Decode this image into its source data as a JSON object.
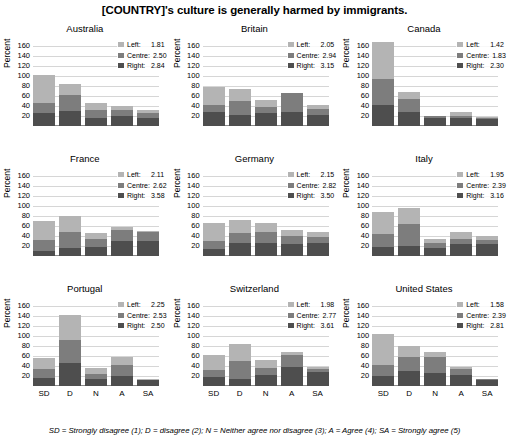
{
  "chart_data": {
    "type": "bar",
    "title": "[COUNTRY]'s culture is generally harmed by immigrants.",
    "subtitle": "",
    "xlabel": "",
    "ylabel": "Percent",
    "ylim": [
      0,
      160
    ],
    "ytick_labels": [
      "20",
      "40",
      "60",
      "80",
      "100",
      "120",
      "140",
      "160"
    ],
    "ytick_values": [
      20,
      40,
      60,
      80,
      100,
      120,
      140,
      160
    ],
    "categories": [
      "SD",
      "D",
      "N",
      "A",
      "SA"
    ],
    "grid": true,
    "stacked": true,
    "legend_position": "upper-right-inside",
    "series_names": [
      "Left",
      "Centre",
      "Right"
    ],
    "series_colors": [
      "#b4b4b4",
      "#7d7d7d",
      "#4e4e4e"
    ],
    "footnote": "SD = Strongly disagree (1); D = disagree (2); N = Neither agree nor disagree (3); A = Agree (4); SA = Strongly agree (5)",
    "panels": [
      {
        "name": "Australia",
        "means": {
          "left": "1.81",
          "centre": "2.50",
          "right": "2.84"
        },
        "series": [
          {
            "name": "Right",
            "values": [
              26,
              29,
              15,
              20,
              16
            ]
          },
          {
            "name": "Centre",
            "values": [
              19,
              32,
              16,
              11,
              9
            ]
          },
          {
            "name": "Left",
            "values": [
              57,
              22,
              14,
              8,
              6
            ]
          }
        ],
        "totals": [
          102,
          83,
          45,
          39,
          31
        ]
      },
      {
        "name": "Britain",
        "means": {
          "left": "2.05",
          "centre": "2.94",
          "right": "3.15"
        },
        "series": [
          {
            "name": "Right",
            "values": [
              27,
              22,
              25,
              28,
              21
            ]
          },
          {
            "name": "Centre",
            "values": [
              14,
              27,
              13,
              37,
              12
            ]
          },
          {
            "name": "Left",
            "values": [
              36,
              25,
              13,
              0,
              8
            ]
          }
        ],
        "totals": [
          77,
          74,
          51,
          65,
          41
        ]
      },
      {
        "name": "Canada",
        "means": {
          "left": "1.42",
          "centre": "1.83",
          "right": "2.30"
        },
        "series": [
          {
            "name": "Right",
            "values": [
              41,
              27,
              15,
              16,
              13
            ]
          },
          {
            "name": "Centre",
            "values": [
              52,
              26,
              4,
              3,
              3
            ]
          },
          {
            "name": "Left",
            "values": [
              75,
              15,
              1,
              8,
              1
            ]
          }
        ],
        "totals": [
          168,
          68,
          20,
          27,
          17
        ]
      },
      {
        "name": "France",
        "means": {
          "left": "2.11",
          "centre": "2.62",
          "right": "3.58"
        },
        "series": [
          {
            "name": "Right",
            "values": [
              9,
              15,
              17,
              30,
              30
            ]
          },
          {
            "name": "Centre",
            "values": [
              22,
              33,
              16,
              21,
              18
            ]
          },
          {
            "name": "Left",
            "values": [
              39,
              32,
              12,
              7,
              1
            ]
          }
        ],
        "totals": [
          70,
          80,
          45,
          58,
          49
        ]
      },
      {
        "name": "Germany",
        "means": {
          "left": "2.15",
          "centre": "2.82",
          "right": "3.50"
        },
        "series": [
          {
            "name": "Right",
            "values": [
              13,
              25,
              26,
              23,
              25
            ]
          },
          {
            "name": "Centre",
            "values": [
              17,
              21,
              22,
              17,
              12
            ]
          },
          {
            "name": "Left",
            "values": [
              35,
              26,
              18,
              11,
              11
            ]
          }
        ],
        "totals": [
          65,
          72,
          66,
          51,
          48
        ]
      },
      {
        "name": "Italy",
        "means": {
          "left": "1.95",
          "centre": "2.39",
          "right": "3.16"
        },
        "series": [
          {
            "name": "Right",
            "values": [
              17,
              20,
              16,
              23,
              24
            ]
          },
          {
            "name": "Centre",
            "values": [
              27,
              43,
              9,
              10,
              8
            ]
          },
          {
            "name": "Left",
            "values": [
              44,
              32,
              8,
              15,
              7
            ]
          }
        ],
        "totals": [
          88,
          95,
          33,
          48,
          39
        ]
      },
      {
        "name": "Portugal",
        "means": {
          "left": "2.25",
          "centre": "2.53",
          "right": "2.50"
        },
        "series": [
          {
            "name": "Right",
            "values": [
              15,
              45,
              13,
              19,
              11
            ]
          },
          {
            "name": "Centre",
            "values": [
              19,
              47,
              11,
              22,
              1
            ]
          },
          {
            "name": "Left",
            "values": [
              21,
              50,
              12,
              17,
              1
            ]
          }
        ],
        "totals": [
          55,
          142,
          36,
          58,
          13
        ]
      },
      {
        "name": "Switzerland",
        "means": {
          "left": "1.98",
          "centre": "2.77",
          "right": "3.61"
        },
        "series": [
          {
            "name": "Right",
            "values": [
              18,
              14,
              22,
              37,
              27
            ]
          },
          {
            "name": "Centre",
            "values": [
              13,
              36,
              14,
              25,
              6
            ]
          },
          {
            "name": "Left",
            "values": [
              31,
              33,
              15,
              6,
              5
            ]
          }
        ],
        "totals": [
          62,
          83,
          51,
          68,
          38
        ]
      },
      {
        "name": "United States",
        "means": {
          "left": "1.58",
          "centre": "2.39",
          "right": "2.81"
        },
        "series": [
          {
            "name": "Right",
            "values": [
              20,
              29,
              25,
              21,
              12
            ]
          },
          {
            "name": "Centre",
            "values": [
              21,
              28,
              33,
              12,
              1
            ]
          },
          {
            "name": "Left",
            "values": [
              63,
              22,
              10,
              5,
              1
            ]
          }
        ],
        "totals": [
          104,
          79,
          68,
          38,
          14
        ]
      }
    ]
  }
}
